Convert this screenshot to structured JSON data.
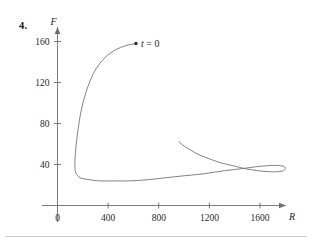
{
  "problem": {
    "number": "4."
  },
  "chart_data": {
    "type": "line",
    "title": "",
    "subtitle": "",
    "xlabel": "R",
    "ylabel": "F",
    "xlim": [
      0,
      1900
    ],
    "ylim": [
      0,
      175
    ],
    "grid": false,
    "legend": null,
    "x_ticks": [
      {
        "value": 0,
        "label": "0"
      },
      {
        "value": 400,
        "label": "400"
      },
      {
        "value": 800,
        "label": "800"
      },
      {
        "value": 1200,
        "label": "1200"
      },
      {
        "value": 1600,
        "label": "1600"
      }
    ],
    "y_ticks": [
      {
        "value": 0,
        "label": "0"
      },
      {
        "value": 40,
        "label": "40"
      },
      {
        "value": 80,
        "label": "80"
      },
      {
        "value": 120,
        "label": "120"
      },
      {
        "value": 160,
        "label": "160"
      }
    ],
    "annotations": [
      {
        "name": "initial-point",
        "text": "t = 0",
        "text_prefix": "t",
        "text_suffix": "= 0",
        "point": [
          620,
          158
        ],
        "marker": "dot"
      }
    ],
    "series": [
      {
        "name": "trajectory",
        "color": "#6b6b6b",
        "points": [
          [
            620,
            158
          ],
          [
            540,
            156
          ],
          [
            460,
            152
          ],
          [
            390,
            146
          ],
          [
            330,
            138
          ],
          [
            280,
            128
          ],
          [
            240,
            116
          ],
          [
            205,
            102
          ],
          [
            180,
            88
          ],
          [
            162,
            74
          ],
          [
            150,
            62
          ],
          [
            142,
            52
          ],
          [
            138,
            44
          ],
          [
            137,
            38
          ],
          [
            140,
            34
          ],
          [
            148,
            31
          ],
          [
            160,
            29
          ],
          [
            180,
            27
          ],
          [
            210,
            26
          ],
          [
            260,
            25
          ],
          [
            330,
            24
          ],
          [
            430,
            24
          ],
          [
            560,
            24
          ],
          [
            700,
            25
          ],
          [
            850,
            27
          ],
          [
            1000,
            29
          ],
          [
            1160,
            31
          ],
          [
            1320,
            34
          ],
          [
            1460,
            36
          ],
          [
            1580,
            38
          ],
          [
            1680,
            39
          ],
          [
            1750,
            39
          ],
          [
            1790,
            38
          ],
          [
            1800,
            36
          ],
          [
            1785,
            34
          ],
          [
            1740,
            33
          ],
          [
            1670,
            33
          ],
          [
            1580,
            34
          ],
          [
            1480,
            36
          ],
          [
            1380,
            39
          ],
          [
            1280,
            42
          ],
          [
            1190,
            46
          ],
          [
            1110,
            50
          ],
          [
            1040,
            55
          ],
          [
            990,
            59
          ],
          [
            960,
            62
          ]
        ]
      }
    ]
  }
}
